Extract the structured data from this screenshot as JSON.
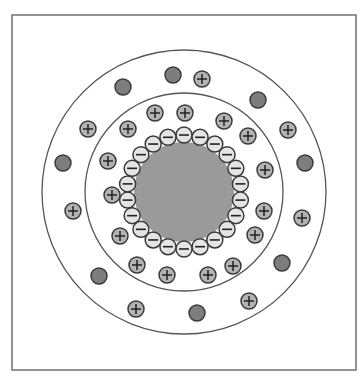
{
  "diagram": {
    "title": "",
    "frame": {
      "x": 12,
      "y": 15,
      "w": 344,
      "h": 355
    },
    "center": {
      "x": 184,
      "y": 192
    },
    "colors": {
      "frame_stroke": "#6f6f6f",
      "ring_stroke": "#555555",
      "core_fill": "#9a9a9a",
      "anion_fill": "#e4e4e4",
      "cation_fill": "#b3b3b3",
      "neutral_fill": "#7d7d7d",
      "particle_stroke": "#3a3a3a"
    },
    "rings": [
      {
        "name": "outer-boundary",
        "r": 142
      },
      {
        "name": "inner-boundary",
        "r": 99
      }
    ],
    "core": {
      "r": 50,
      "label": "particle-core"
    },
    "anion_layer": {
      "r": 57,
      "count": 22,
      "ion_r": 8,
      "sign": "−"
    },
    "cations": [
      {
        "x": 155,
        "y": 113
      },
      {
        "x": 185,
        "y": 113
      },
      {
        "x": 128,
        "y": 129
      },
      {
        "x": 224,
        "y": 121
      },
      {
        "x": 248,
        "y": 136
      },
      {
        "x": 108,
        "y": 161
      },
      {
        "x": 265,
        "y": 170
      },
      {
        "x": 112,
        "y": 195
      },
      {
        "x": 264,
        "y": 211
      },
      {
        "x": 120,
        "y": 236
      },
      {
        "x": 255,
        "y": 235
      },
      {
        "x": 137,
        "y": 265
      },
      {
        "x": 233,
        "y": 266
      },
      {
        "x": 167,
        "y": 275
      },
      {
        "x": 208,
        "y": 275
      },
      {
        "x": 88,
        "y": 129
      },
      {
        "x": 202,
        "y": 79
      },
      {
        "x": 288,
        "y": 130
      },
      {
        "x": 73,
        "y": 211
      },
      {
        "x": 302,
        "y": 218
      },
      {
        "x": 136,
        "y": 309
      },
      {
        "x": 249,
        "y": 301
      }
    ],
    "cation_sign": "+",
    "neutrals": [
      {
        "x": 123,
        "y": 87
      },
      {
        "x": 173,
        "y": 75
      },
      {
        "x": 258,
        "y": 100
      },
      {
        "x": 63,
        "y": 163
      },
      {
        "x": 305,
        "y": 163
      },
      {
        "x": 99,
        "y": 276
      },
      {
        "x": 282,
        "y": 263
      },
      {
        "x": 197,
        "y": 313
      }
    ],
    "particle_r": 8
  }
}
